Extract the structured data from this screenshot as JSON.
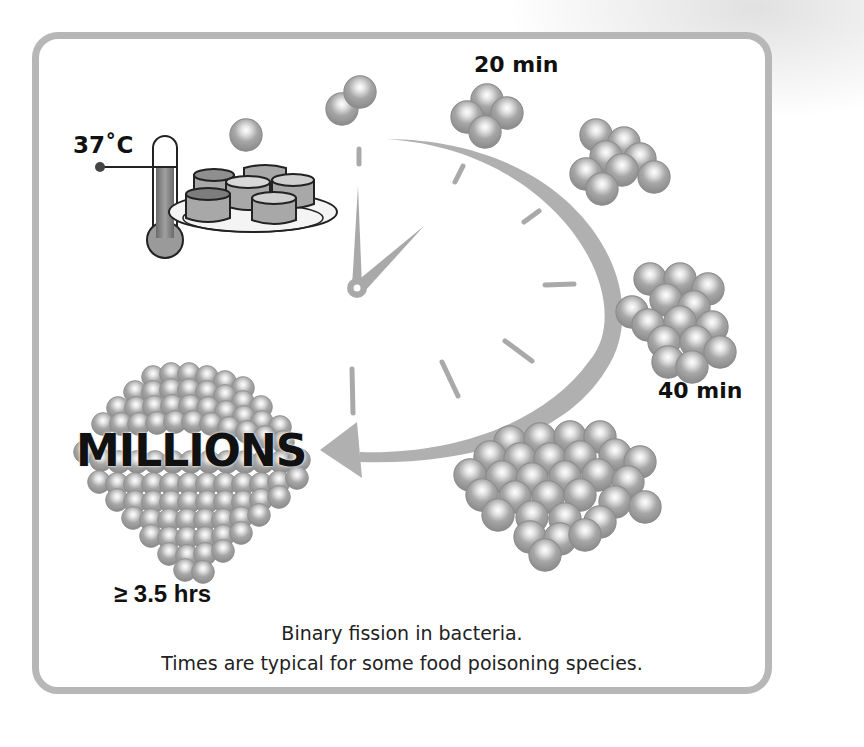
{
  "diagram": {
    "temperature_label": "37˚C",
    "stage_labels": {
      "first": "20 min",
      "second": "40 min",
      "final_count": "MILLIONS",
      "final_time": "≥ 3.5 hrs"
    },
    "caption": {
      "line1": "Binary fission in bacteria.",
      "line2": "Times are typical for some food poisoning species."
    },
    "icons": [
      "thermometer-icon",
      "food-plate-icon",
      "clock-icon",
      "curved-arrow-icon",
      "bacteria-cluster-icon"
    ],
    "colors": {
      "frame": "#b7b7b7",
      "clock_gray": "#a9a9a9",
      "bacteria": "#9d9d9d",
      "text": "#111111"
    }
  }
}
